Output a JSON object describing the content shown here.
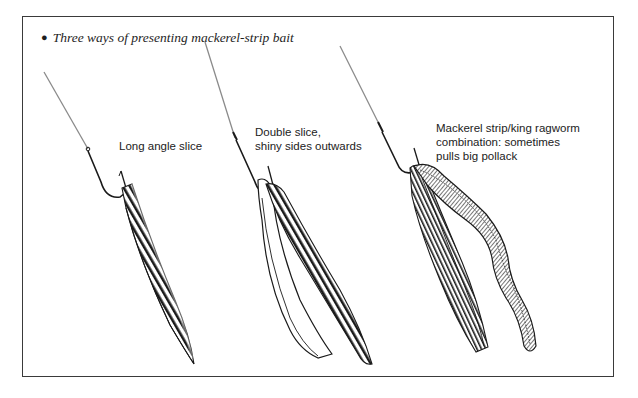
{
  "figure": {
    "caption_bullet": "●",
    "caption": "Three ways of presenting mackerel-strip bait",
    "border_color": "#3a3a3a",
    "ink_color": "#1a1a1a",
    "line_color": "#8a8a8a"
  },
  "baits": [
    {
      "id": "long-angle-slice",
      "label": "Long angle slice"
    },
    {
      "id": "double-slice",
      "label": "Double slice,\nshiny sides outwards"
    },
    {
      "id": "mackerel-ragworm-combo",
      "label": "Mackerel strip/king ragworm\ncombination: sometimes\npulls big pollack"
    }
  ]
}
